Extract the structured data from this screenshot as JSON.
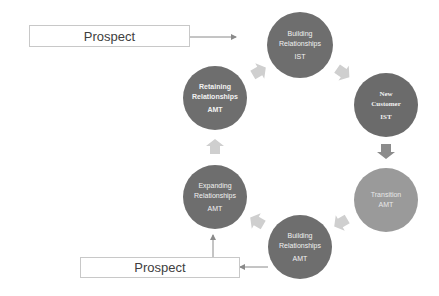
{
  "diagram": {
    "prospect_top": {
      "label": "Prospect"
    },
    "prospect_bottom": {
      "label": "Prospect"
    },
    "stages": [
      {
        "line1": "Building",
        "line2": "Relationships",
        "owner": "IST",
        "color": "#6e6e6e"
      },
      {
        "line1": "New",
        "line2": "Customer",
        "owner": "IST",
        "color": "#6b6b6b"
      },
      {
        "line1": "Transition",
        "line2": "",
        "owner": "AMT",
        "color": "#9a9a9a"
      },
      {
        "line1": "Building",
        "line2": "Relationships",
        "owner": "AMT",
        "color": "#6e6e6e"
      },
      {
        "line1": "Expanding",
        "line2": "Relationships",
        "owner": "AMT",
        "color": "#6e6e6e"
      },
      {
        "line1": "Retaining",
        "line2": "Relationships",
        "owner": "AMT",
        "color": "#6e6e6e"
      }
    ],
    "colors": {
      "arrow": "#cfcfcf",
      "arrow_dark": "#8c8c8c",
      "line": "#8a8a8a"
    }
  }
}
